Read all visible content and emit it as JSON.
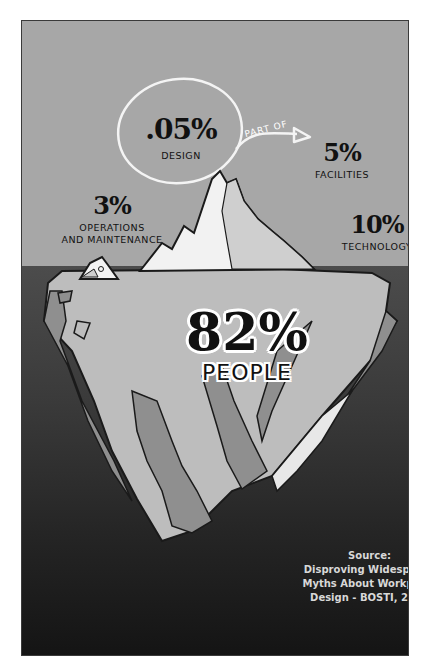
{
  "infographic": {
    "title_hint": "Iceberg of workplace costs",
    "above_water": [
      {
        "id": "design",
        "value": ".05%",
        "label": "DESIGN"
      },
      {
        "id": "facilities",
        "value": "5%",
        "label": "FACILITIES"
      },
      {
        "id": "operations",
        "value": "3%",
        "label_line1": "OPERATIONS",
        "label_line2": "AND MAINTENANCE"
      },
      {
        "id": "technology",
        "value": "10%",
        "label": "TECHNOLOGY"
      }
    ],
    "annotation": {
      "arrow_label": "PART OF",
      "from": "DESIGN",
      "to": "FACILITIES"
    },
    "below_water": {
      "value": "82%",
      "label": "PEOPLE"
    },
    "source": {
      "line1": "Source:",
      "line2": "Disproving Widespread",
      "line3": "Myths About Workplace",
      "line4": "Design - BOSTI, 2001"
    },
    "colors": {
      "sky": "#a7a7a7",
      "water_top": "#4c4c4c",
      "water_bottom": "#141414",
      "ice_light": "#f2f2f2",
      "ice_mid": "#bdbdbd",
      "ice_dark": "#8f8f8f",
      "outline": "#1a1a1a",
      "text": "#111111",
      "source_text": "#d8d8d8"
    }
  }
}
